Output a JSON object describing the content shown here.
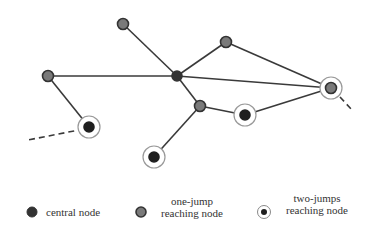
{
  "colors": {
    "edge": "#3a3a3a",
    "central_fill": "#333333",
    "one_jump_fill": "#7a7a7a",
    "one_jump_stroke": "#333333",
    "ring": "#999999",
    "two_jump_fill": "#1f1f1f"
  },
  "nodes": [
    {
      "id": "n_top",
      "x": 123,
      "y": 24,
      "type": "one-jump",
      "ring": false
    },
    {
      "id": "n_upper_right",
      "x": 226,
      "y": 42,
      "type": "one-jump",
      "ring": false
    },
    {
      "id": "n_left",
      "x": 48,
      "y": 76,
      "type": "one-jump",
      "ring": false
    },
    {
      "id": "n_central",
      "x": 177,
      "y": 76,
      "type": "central",
      "ring": false
    },
    {
      "id": "n_right",
      "x": 331,
      "y": 88,
      "type": "one-jump",
      "ring": true
    },
    {
      "id": "n_mid",
      "x": 200,
      "y": 106,
      "type": "one-jump",
      "ring": false
    },
    {
      "id": "n_mid_ring",
      "x": 245,
      "y": 115,
      "type": "two-jumps",
      "ring": true
    },
    {
      "id": "n_lower_left",
      "x": 89,
      "y": 127,
      "type": "two-jumps",
      "ring": true
    },
    {
      "id": "n_bottom",
      "x": 154,
      "y": 157,
      "type": "two-jumps",
      "ring": true
    }
  ],
  "edges": [
    {
      "from": "n_central",
      "to": "n_top",
      "dashed": false
    },
    {
      "from": "n_central",
      "to": "n_upper_right",
      "dashed": false
    },
    {
      "from": "n_central",
      "to": "n_left",
      "dashed": false
    },
    {
      "from": "n_central",
      "to": "n_right",
      "dashed": false
    },
    {
      "from": "n_central",
      "to": "n_mid",
      "dashed": false
    },
    {
      "from": "n_upper_right",
      "to": "n_right",
      "dashed": false
    },
    {
      "from": "n_mid",
      "to": "n_mid_ring",
      "dashed": false
    },
    {
      "from": "n_mid_ring",
      "to": "n_right",
      "dashed": false
    },
    {
      "from": "n_mid",
      "to": "n_bottom",
      "dashed": false
    },
    {
      "from": "n_left",
      "to": "n_lower_left",
      "dashed": false
    }
  ],
  "dashed_stubs": [
    {
      "x1": 84,
      "y1": 129,
      "x2": 28,
      "y2": 140
    },
    {
      "x1": 340,
      "y1": 97,
      "x2": 352,
      "y2": 110
    }
  ],
  "legend": {
    "central": {
      "label": "central node"
    },
    "one_jump": {
      "line1": "one-jump",
      "line2": "reaching node"
    },
    "two_jumps": {
      "line1": "two-jumps",
      "line2": "reaching node"
    }
  }
}
